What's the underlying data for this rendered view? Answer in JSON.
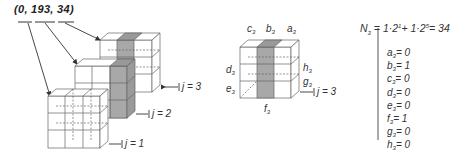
{
  "title": "(0, 193, 34)",
  "left_diagram": {
    "layers": [
      {
        "label": "j = 1",
        "shaded_column": "none"
      },
      {
        "label": "j = 2",
        "shaded_column": "right"
      },
      {
        "label": "j = 3",
        "shaded_column": "middle"
      }
    ]
  },
  "center_diagram": {
    "top_labels": [
      "c",
      "b",
      "a"
    ],
    "left_labels": [
      "d",
      "e"
    ],
    "right_labels": [
      "h",
      "g"
    ],
    "bottom_label": "f",
    "subscript": "3",
    "layer_label": "j = 3"
  },
  "equation": {
    "lhs": "N",
    "lhs_sub": "3",
    "text_1": "= 1·2",
    "exp_1": "1",
    "text_2": "+ 1·2",
    "exp_2": "5",
    "result": "= 34"
  },
  "values": [
    {
      "var": "a",
      "sub": "3",
      "val": "= 0"
    },
    {
      "var": "b",
      "sub": "3",
      "val": "= 1"
    },
    {
      "var": "c",
      "sub": "3",
      "val": "= 0"
    },
    {
      "var": "d",
      "sub": "3",
      "val": "= 0"
    },
    {
      "var": "e",
      "sub": "3",
      "val": "= 0"
    },
    {
      "var": "f",
      "sub": "3",
      "val": "= 1"
    },
    {
      "var": "g",
      "sub": "3",
      "val": "= 0"
    },
    {
      "var": "h",
      "sub": "3",
      "val": "= 0"
    }
  ],
  "colors": {
    "shade": "#a8a8a8",
    "line": "#555555"
  }
}
